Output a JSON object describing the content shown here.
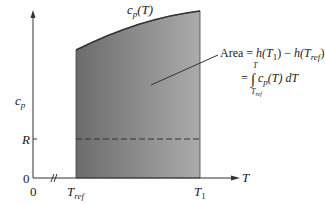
{
  "diagram": {
    "axes": {
      "y_label": "c",
      "y_label_sub": "p",
      "x_label": "T",
      "y_ticks": [
        {
          "label": "R",
          "value": "R"
        },
        {
          "label": "0",
          "value": 0
        }
      ],
      "x_ticks": [
        {
          "label": "0"
        },
        {
          "label": "T",
          "sub": "ref"
        },
        {
          "label": "T",
          "sub": "1"
        }
      ],
      "x_axis_break": "≈"
    },
    "curve_label": {
      "main": "c",
      "sub": "p",
      "arg": "(T)"
    },
    "annotation": {
      "line1_prefix": "Area = ",
      "line1_h1": "h",
      "line1_T1": "(T",
      "line1_T1_sub": "1",
      "line1_close": ") − ",
      "line1_h2": "h",
      "line1_Tref": "(T",
      "line1_Tref_sub": "ref",
      "line1_close2": ")",
      "line2_prefix": "= ",
      "integral_upper": "T",
      "integral_lower": "T",
      "integral_lower_sub": "ref",
      "integrand": "c",
      "integrand_sub": "p",
      "integrand_arg": "(T) dT"
    },
    "colors": {
      "shade_left": "#6f6f6f",
      "shade_right": "#a9a9a9",
      "axis": "#333333",
      "dashed": "#333333"
    }
  }
}
